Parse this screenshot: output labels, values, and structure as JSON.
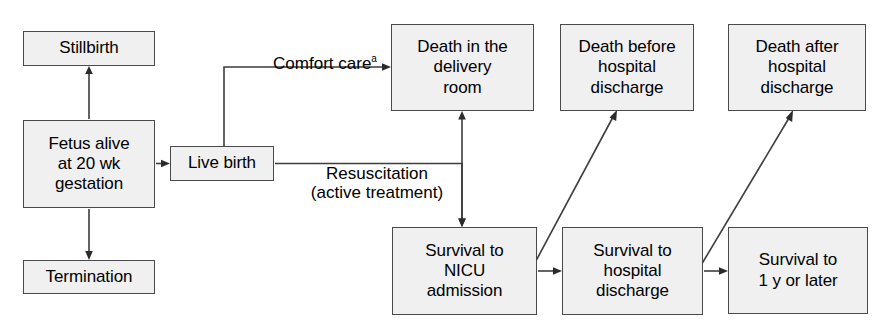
{
  "diagram": {
    "style": {
      "node_fill": "#f0f0f0",
      "node_border": "#4a4a4a",
      "line_color": "#3d3d3d",
      "text_color": "#000000",
      "background": "#ffffff"
    },
    "nodes": [
      {
        "id": "stillbirth",
        "label": "Stillbirth",
        "x": 23,
        "y": 31,
        "w": 132,
        "h": 35
      },
      {
        "id": "fetus-alive",
        "label": "Fetus alive\nat 20 wk\ngestation",
        "x": 23,
        "y": 120,
        "w": 132,
        "h": 88
      },
      {
        "id": "termination",
        "label": "Termination",
        "x": 23,
        "y": 260,
        "w": 132,
        "h": 34
      },
      {
        "id": "live-birth",
        "label": "Live birth",
        "x": 170,
        "y": 146,
        "w": 104,
        "h": 35
      },
      {
        "id": "death-delivery-room",
        "label": "Death in the\ndelivery\nroom",
        "x": 391,
        "y": 24,
        "w": 143,
        "h": 87
      },
      {
        "id": "death-before-discharge",
        "label": "Death before\nhospital\ndischarge",
        "x": 560,
        "y": 24,
        "w": 134,
        "h": 87
      },
      {
        "id": "death-after-discharge",
        "label": "Death after\nhospital\ndischarge",
        "x": 728,
        "y": 24,
        "w": 138,
        "h": 87
      },
      {
        "id": "survival-nicu",
        "label": "Survival to\nNICU\nadmission",
        "x": 392,
        "y": 227,
        "w": 145,
        "h": 88
      },
      {
        "id": "survival-discharge",
        "label": "Survival to\nhospital\ndischarge",
        "x": 562,
        "y": 227,
        "w": 141,
        "h": 88
      },
      {
        "id": "survival-1y",
        "label": "Survival to\n1 y or later",
        "x": 728,
        "y": 227,
        "w": 140,
        "h": 87
      }
    ],
    "edge_labels": [
      {
        "id": "comfort-care",
        "text": "Comfort care",
        "superscript": "a",
        "x": 245,
        "y": 34,
        "w": 160
      },
      {
        "id": "resuscitation",
        "text": "Resuscitation\n(active treatment)",
        "superscript": "",
        "x": 286,
        "y": 144,
        "w": 182
      }
    ],
    "edges": [
      {
        "id": "fetus-to-stillbirth",
        "from": "fetus-alive",
        "to": "stillbirth",
        "kind": "vertical-up",
        "arrow": "single"
      },
      {
        "id": "fetus-to-termination",
        "from": "fetus-alive",
        "to": "termination",
        "kind": "vertical-down",
        "arrow": "single"
      },
      {
        "id": "fetus-to-live-birth",
        "from": "fetus-alive",
        "to": "live-birth",
        "kind": "horizontal",
        "arrow": "single"
      },
      {
        "id": "live-birth-to-death-delivery",
        "from": "live-birth",
        "to": "death-delivery-room",
        "kind": "elbow-up-right",
        "arrow": "single"
      },
      {
        "id": "live-birth-to-nicu",
        "from": "live-birth",
        "to": "survival-nicu",
        "kind": "elbow-right-down",
        "arrow": "single"
      },
      {
        "id": "nicu-to-death-delivery",
        "from": "survival-nicu",
        "to": "death-delivery-room",
        "kind": "vertical",
        "arrow": "double"
      },
      {
        "id": "nicu-to-survival-discharge",
        "from": "survival-nicu",
        "to": "survival-discharge",
        "kind": "horizontal",
        "arrow": "single"
      },
      {
        "id": "nicu-to-death-before-discharge",
        "from": "survival-nicu",
        "to": "death-before-discharge",
        "kind": "diagonal",
        "arrow": "single"
      },
      {
        "id": "discharge-to-survival-1y",
        "from": "survival-discharge",
        "to": "survival-1y",
        "kind": "horizontal",
        "arrow": "single"
      },
      {
        "id": "discharge-to-death-after-discharge",
        "from": "survival-discharge",
        "to": "death-after-discharge",
        "kind": "diagonal",
        "arrow": "single"
      }
    ]
  }
}
